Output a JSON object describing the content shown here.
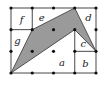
{
  "diagram": {
    "type": "grid-area-figure",
    "grid": {
      "cols": 4,
      "rows": 3,
      "origin_px": [
        11,
        8
      ],
      "step_px": [
        21.25,
        21.67
      ]
    },
    "colors": {
      "shade": "#9a9a9a",
      "line": "#333333",
      "dot": "#111111"
    },
    "shaded_polygon": [
      [
        0,
        3
      ],
      [
        1,
        1
      ],
      [
        3,
        0
      ],
      [
        4,
        2
      ],
      [
        3,
        1
      ]
    ],
    "inner_lines": [
      [
        [
          1,
          0
        ],
        [
          1,
          1
        ]
      ],
      [
        [
          0,
          1
        ],
        [
          1,
          1
        ]
      ],
      [
        [
          3,
          1
        ],
        [
          3,
          3
        ]
      ],
      [
        [
          3,
          2
        ],
        [
          4,
          2
        ]
      ]
    ],
    "labels": [
      {
        "text": "f",
        "pos": [
          0.5,
          0.55
        ]
      },
      {
        "text": "e",
        "pos": [
          1.45,
          0.45
        ]
      },
      {
        "text": "d",
        "pos": [
          3.65,
          0.45
        ]
      },
      {
        "text": "g",
        "pos": [
          0.3,
          1.5
        ]
      },
      {
        "text": "c",
        "pos": [
          3.4,
          1.65
        ]
      },
      {
        "text": "a",
        "pos": [
          2.4,
          2.55
        ]
      },
      {
        "text": "b",
        "pos": [
          3.5,
          2.6
        ]
      }
    ]
  }
}
